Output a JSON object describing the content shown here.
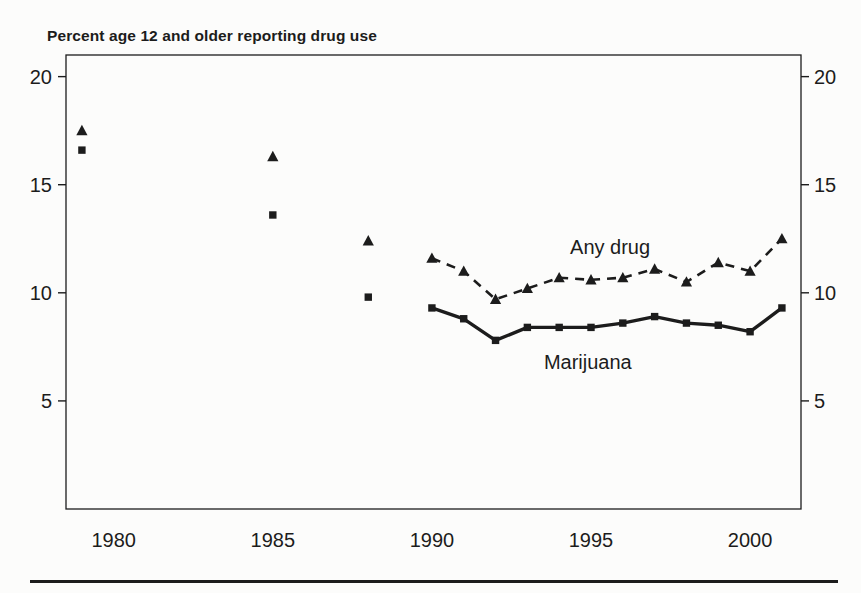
{
  "colors": {
    "ink": "#1c1c1c",
    "background": "#fcfcfb"
  },
  "chart_data": {
    "type": "line",
    "title": "Percent age 12 and older reporting drug use",
    "xlabel": "",
    "ylabel": "Percent age 12 and older reporting drug use",
    "grid": false,
    "legend_position": "inline-annotations",
    "x_axis": {
      "range": [
        1978.5,
        2001.6
      ],
      "tick_values": [
        1980,
        1985,
        1990,
        1995,
        2000
      ],
      "tick_labels": [
        "1980",
        "1985",
        "1990",
        "1995",
        "2000"
      ]
    },
    "y_axis": {
      "range": [
        0,
        21
      ],
      "tick_values": [
        5,
        10,
        15,
        20
      ],
      "tick_labels": [
        "5",
        "10",
        "15",
        "20"
      ],
      "labels_on_both_sides": true
    },
    "series": [
      {
        "name": "Any drug",
        "marker": "triangle",
        "line_style": "dashed",
        "scatter_points": {
          "x": [
            1979,
            1985,
            1988
          ],
          "y": [
            17.5,
            16.3,
            12.4
          ]
        },
        "line_points": {
          "x": [
            1990,
            1991,
            1992,
            1993,
            1994,
            1995,
            1996,
            1997,
            1998,
            1999,
            2000,
            2001
          ],
          "y": [
            11.6,
            11.0,
            9.7,
            10.2,
            10.7,
            10.6,
            10.7,
            11.1,
            10.5,
            11.4,
            11.0,
            12.5
          ]
        },
        "label": {
          "text": "Any drug",
          "x": 1995.6,
          "y": 12.1
        }
      },
      {
        "name": "Marijuana",
        "marker": "square",
        "line_style": "solid",
        "scatter_points": {
          "x": [
            1979,
            1985,
            1988
          ],
          "y": [
            16.6,
            13.6,
            9.8
          ]
        },
        "line_points": {
          "x": [
            1990,
            1991,
            1992,
            1993,
            1994,
            1995,
            1996,
            1997,
            1998,
            1999,
            2000,
            2001
          ],
          "y": [
            9.3,
            8.8,
            7.8,
            8.4,
            8.4,
            8.4,
            8.6,
            8.9,
            8.6,
            8.5,
            8.2,
            9.3
          ]
        },
        "label": {
          "text": "Marijuana",
          "x": 1994.9,
          "y": 6.8
        }
      }
    ]
  }
}
